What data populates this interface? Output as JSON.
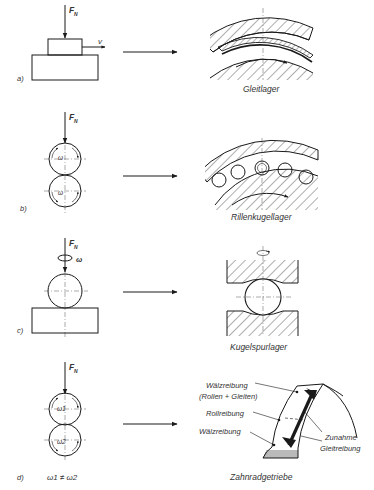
{
  "figure": {
    "panels": [
      {
        "id": "a",
        "label": "a)",
        "force_label": "F",
        "force_subscript": "N",
        "velocity_label": "v",
        "result_caption": "Gleitlager",
        "principle": "sliding block on base"
      },
      {
        "id": "b",
        "label": "b)",
        "force_label": "F",
        "force_subscript": "N",
        "omega_top": "ω",
        "omega_bottom": "ω",
        "result_caption": "Rillenkugellager",
        "principle": "two rolling cylinders"
      },
      {
        "id": "c",
        "label": "c)",
        "force_label": "F",
        "force_subscript": "N",
        "omega": "ω",
        "result_caption": "Kugelspurlager",
        "principle": "ball spinning on plate"
      },
      {
        "id": "d",
        "label": "d)",
        "force_label": "F",
        "force_subscript": "N",
        "omega_top": "ω1",
        "omega_bottom": "ω2",
        "condition": "ω1 ≠ ω2",
        "result_caption": "Zahnradgetriebe",
        "annotations": {
          "walz_top": "Wälzreibung",
          "walz_top_sub": "(Rollen + Gleiten)",
          "roll": "Rollreibung",
          "walz_bottom": "Wälzreibung",
          "zunahme": "Zunahme",
          "gleit": "Gleitreibung"
        }
      }
    ]
  }
}
